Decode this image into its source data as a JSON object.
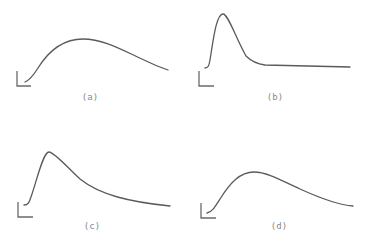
{
  "figure": {
    "line_color": "#5a5a5a",
    "axis_color": "#6a6a6a",
    "label_color": "#8a8a8a",
    "panels": [
      {
        "id": "a",
        "label": "(a)",
        "shape": "broad hump, gradual rise to peak then slow decay",
        "axis": {
          "x": 17,
          "y_top": 71,
          "y_bottom": 86,
          "x_right": 31
        },
        "path": "M25,82 C30,80 33,76 38,68 C48,52 62,39 83,39 C104,39 124,51 144,60 C154,65 162,68 168,70",
        "label_pos": {
          "x": 90,
          "y": 100
        }
      },
      {
        "id": "b",
        "label": "(b)",
        "shape": "sharp early peak, rapid decay, flat plateau",
        "axis": {
          "x": 199,
          "y_top": 71,
          "y_bottom": 86,
          "x_right": 214
        },
        "path": "M205,68 C208,68 209,66 210,60 C213,42 216,14 223,14 C228,14 235,36 246,56 C252,62 258,64 265,65 L350,67",
        "label_pos": {
          "x": 275,
          "y": 100
        }
      },
      {
        "id": "c",
        "label": "(c)",
        "shape": "sharp rise to early peak, long exponential-like tail",
        "axis": {
          "x": 18,
          "y_top": 202,
          "y_bottom": 217,
          "x_right": 33
        },
        "path": "M24,205 C28,205 29,203 31,197 C37,180 43,152 49,152 C54,152 66,166 80,179 C100,195 130,202 170,206",
        "label_pos": {
          "x": 92,
          "y": 229
        }
      },
      {
        "id": "d",
        "label": "(d)",
        "shape": "moderate rise to peak, gradual decay",
        "axis": {
          "x": 201,
          "y_top": 203,
          "y_bottom": 218,
          "x_right": 216
        },
        "path": "M207,213 C212,212 215,207 220,199 C230,183 240,172 254,172 C268,172 284,182 300,189 C322,199 338,205 353,206",
        "label_pos": {
          "x": 279,
          "y": 229
        }
      }
    ]
  }
}
